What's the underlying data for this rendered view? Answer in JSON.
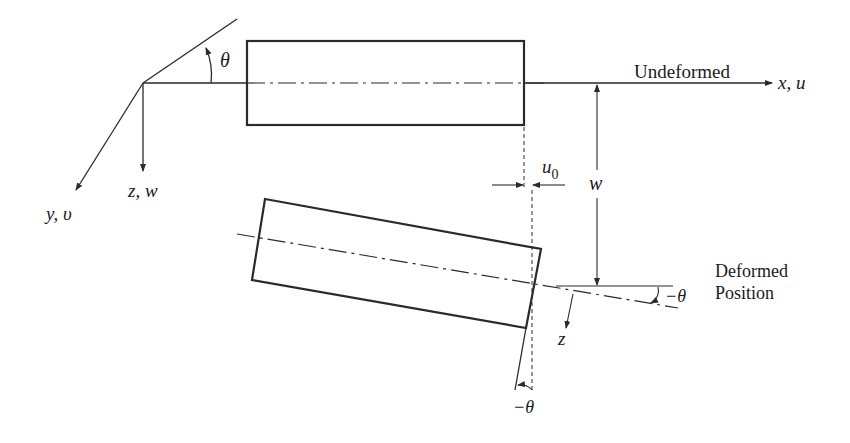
{
  "diagram": {
    "type": "beam-deformation",
    "labels": {
      "theta": "θ",
      "x_axis": "x, u",
      "y_axis": "y, υ",
      "z_axis": "z, w",
      "undeformed": "Undeformed",
      "deformed_line1": "Deformed",
      "deformed_line2": "Position",
      "u0_main": "u",
      "u0_sub": "0",
      "w": "w",
      "neg_theta_right": "−θ",
      "neg_theta_bottom": "−θ",
      "z_local": "z"
    },
    "colors": {
      "line": "#2a2a2a",
      "background": "#ffffff"
    }
  }
}
